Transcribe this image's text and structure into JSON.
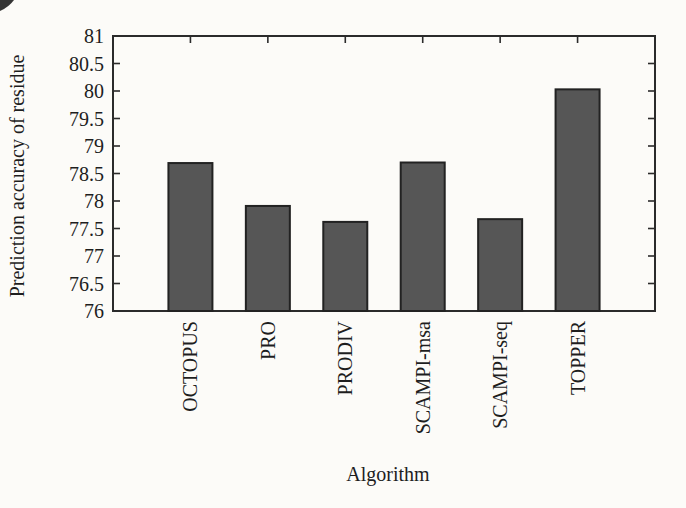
{
  "chart_data": {
    "type": "bar",
    "title": "",
    "categories": [
      "OCTOPUS",
      "PRO",
      "PRODIV",
      "SCAMPI-msa",
      "SCAMPI-seq",
      "TOPPER"
    ],
    "values": [
      78.69,
      77.91,
      77.62,
      78.7,
      77.67,
      80.03
    ],
    "xlabel": "Algorithm",
    "ylabel": "Prediction accuracy of residue",
    "ylim": [
      76,
      81
    ],
    "ytick_step": 0.5,
    "yticks": [
      "76",
      "76.5",
      "77",
      "77.5",
      "78",
      "78.5",
      "79",
      "79.5",
      "80",
      "80.5",
      "81"
    ],
    "grid": false,
    "legend_visible": false,
    "x_labels_rotation_deg": -90,
    "bar_color": "#565656",
    "bar_edge_color": "#222222",
    "axis_color": "#2b2b2b",
    "text_color": "#1e1e1e",
    "background_color": "#fcfbf8"
  }
}
